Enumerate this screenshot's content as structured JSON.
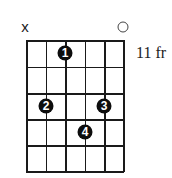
{
  "chart": {
    "type": "guitar-chord-diagram",
    "strings": 6,
    "frets_shown": 5,
    "start_fret_label": "11 fr",
    "string_markers": [
      {
        "string": 1,
        "symbol": "x",
        "meaning": "muted"
      },
      {
        "string": 6,
        "symbol": "○",
        "meaning": "open"
      }
    ],
    "fingers": [
      {
        "label": "1",
        "string": 3,
        "fret": 1
      },
      {
        "label": "2",
        "string": 2,
        "fret": 3
      },
      {
        "label": "3",
        "string": 5,
        "fret": 3
      },
      {
        "label": "4",
        "string": 4,
        "fret": 4
      }
    ]
  }
}
